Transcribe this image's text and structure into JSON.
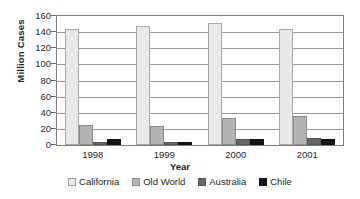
{
  "chart_data": {
    "type": "bar",
    "title": "",
    "xlabel": "Year",
    "ylabel": "Million Cases",
    "categories": [
      "1998",
      "1999",
      "2000",
      "2001"
    ],
    "series": [
      {
        "name": "California",
        "values": [
          144,
          147,
          151,
          144
        ],
        "color": "#e9e9e9"
      },
      {
        "name": "Old World",
        "values": [
          25,
          23,
          34,
          36
        ],
        "color": "#b4b4b4"
      },
      {
        "name": "Australia",
        "values": [
          4,
          4,
          7,
          9
        ],
        "color": "#666666"
      },
      {
        "name": "Chile",
        "values": [
          7,
          4,
          8,
          7
        ],
        "color": "#161616"
      }
    ],
    "ylim": [
      0,
      160
    ],
    "ytick_labels": [
      "160",
      "140",
      "120",
      "100",
      "80",
      "60",
      "40",
      "20",
      "0"
    ],
    "ytick_values": [
      160,
      140,
      120,
      100,
      80,
      60,
      40,
      20,
      0
    ],
    "grid": true,
    "legend_position": "bottom"
  }
}
